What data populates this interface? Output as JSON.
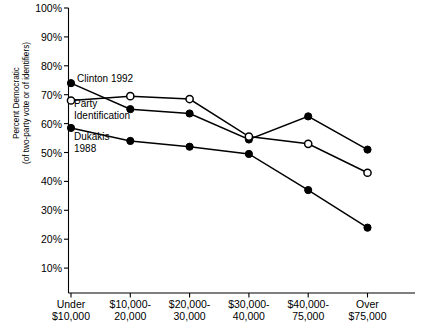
{
  "chart_data": {
    "type": "line",
    "title": "",
    "xlabel": "",
    "ylabel": "Percent Democratic\n(of two-party vote or of identifiers)",
    "ylabel_line1": "Percent Democratic",
    "ylabel_line2": "(of two-party vote or of identifiers)",
    "categories": [
      "Under\n$10,000",
      "$10,000-\n20,000",
      "$20,000-\n30,000",
      "$30,000-\n40,000",
      "$40,000-\n75,000",
      "Over\n$75,000"
    ],
    "ylim": [
      0,
      100
    ],
    "yticks": [
      "10%",
      "20%",
      "30%",
      "40%",
      "50%",
      "60%",
      "70%",
      "80%",
      "90%",
      "100%"
    ],
    "ytick_values": [
      10,
      20,
      30,
      40,
      50,
      60,
      70,
      80,
      90,
      100
    ],
    "grid": false,
    "legend_position": "inline-annotations",
    "series": [
      {
        "name": "Clinton 1992",
        "marker": "filled-circle",
        "color": "#000000",
        "values": [
          74,
          65,
          63.5,
          54.5,
          62.5,
          51
        ]
      },
      {
        "name": "Party Identification",
        "marker": "open-circle",
        "color": "#000000",
        "values": [
          68,
          69.5,
          68.5,
          55.5,
          53,
          43
        ]
      },
      {
        "name": "Dukakis 1988",
        "marker": "filled-circle",
        "color": "#000000",
        "values": [
          58.5,
          54,
          52,
          49.5,
          37,
          24
        ]
      }
    ],
    "annotations": [
      {
        "text": "Clinton 1992"
      },
      {
        "text": "Party\nIdentification"
      },
      {
        "text": "Dukakis\n1988"
      }
    ]
  }
}
